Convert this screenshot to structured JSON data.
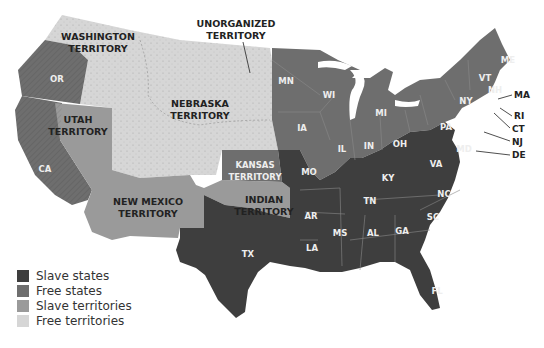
{
  "map": {
    "colors": {
      "slave_states": "#3e3e3e",
      "free_states": "#6e6e6e",
      "slave_territories": "#9a9a9a",
      "free_territories": "#d6d6d6",
      "background": "#ffffff"
    },
    "territories": {
      "washington": [
        "WASHINGTON",
        "TERRITORY"
      ],
      "unorganized": [
        "UNORGANIZED",
        "TERRITORY"
      ],
      "nebraska": [
        "NEBRASKA",
        "TERRITORY"
      ],
      "utah": [
        "UTAH",
        "TERRITORY"
      ],
      "kansas": [
        "KANSAS",
        "TERRITORY"
      ],
      "new_mexico": [
        "NEW MEXICO",
        "TERRITORY"
      ],
      "indian": [
        "INDIAN",
        "TERRITORY"
      ]
    },
    "free_states": [
      "OR",
      "CA",
      "MN",
      "WI",
      "IA",
      "MI",
      "IL",
      "IN",
      "OH",
      "PA",
      "NY",
      "VT",
      "NH",
      "ME",
      "MA",
      "RI",
      "CT",
      "NJ"
    ],
    "slave_states": [
      "MO",
      "AR",
      "LA",
      "TX",
      "KY",
      "TN",
      "MS",
      "AL",
      "GA",
      "FL",
      "SC",
      "NC",
      "VA",
      "MD",
      "DE"
    ],
    "labels": {
      "OR": "OR",
      "CA": "CA",
      "MN": "MN",
      "WI": "WI",
      "IA": "IA",
      "MI": "MI",
      "IL": "IL",
      "IN": "IN",
      "OH": "OH",
      "PA": "PA",
      "NY": "NY",
      "VT": "VT",
      "NH": "NH",
      "ME": "ME",
      "MA": "MA",
      "RI": "RI",
      "CT": "CT",
      "NJ": "NJ",
      "DE": "DE",
      "MD": "MD",
      "VA": "VA",
      "KY": "KY",
      "MO": "MO",
      "AR": "AR",
      "LA": "LA",
      "TX": "TX",
      "TN": "TN",
      "MS": "MS",
      "AL": "AL",
      "GA": "GA",
      "SC": "SC",
      "NC": "NC",
      "FL": "FL"
    }
  },
  "legend": {
    "items": [
      {
        "label": "Slave states",
        "color": "#3e3e3e"
      },
      {
        "label": "Free states",
        "color": "#6e6e6e"
      },
      {
        "label": "Slave territories",
        "color": "#9a9a9a"
      },
      {
        "label": "Free territories",
        "color": "#d6d6d6"
      }
    ]
  }
}
